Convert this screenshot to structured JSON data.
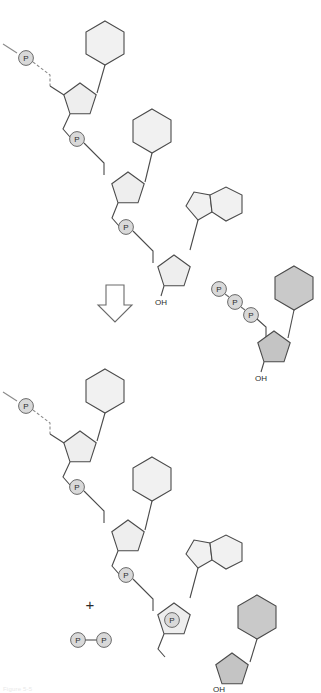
{
  "figure": {
    "kind": "biochemistry-reaction-schematic",
    "caption_partial": "Figure 5-5"
  },
  "labels": {
    "phosphate": "P",
    "hydroxyl": "OH",
    "plus": "+"
  },
  "colors": {
    "stroke": "#4a4a4a",
    "stroke_light": "#8a8a8a",
    "base_pale": "#f1f1f1",
    "base_shaded": "#c9c9c9",
    "sugar_pale": "#eeeeee",
    "sugar_shaded": "#c4c4c4",
    "phosphate_fill": "#d9d9d9",
    "text": "#2b2b2b",
    "arrow_fill": "#ffffff"
  },
  "reactants": {
    "primer_strand": {
      "name": "growing-dna-strand-3-prime-end",
      "chain_continues_label": "",
      "terminal_group": "OH",
      "phosphate_count": 3,
      "nucleotides": [
        {
          "index": 1,
          "base_type": "pyrimidine-hexagon",
          "shaded": false
        },
        {
          "index": 2,
          "base_type": "pyrimidine-hexagon",
          "shaded": false
        },
        {
          "index": 3,
          "base_type": "purine-fused-ring",
          "shaded": false
        }
      ]
    },
    "incoming_nucleotide": {
      "name": "deoxynucleoside-triphosphate",
      "phosphate_count": 3,
      "base_type": "pyrimidine-hexagon",
      "shaded": true,
      "terminal_group": "OH"
    }
  },
  "arrow": {
    "name": "reaction-arrow",
    "direction": "down"
  },
  "products": {
    "extended_strand": {
      "name": "extended-dna-strand",
      "terminal_group": "OH",
      "phosphate_count": 4,
      "nucleotides": [
        {
          "index": 1,
          "base_type": "pyrimidine-hexagon",
          "shaded": false
        },
        {
          "index": 2,
          "base_type": "pyrimidine-hexagon",
          "shaded": false
        },
        {
          "index": 3,
          "base_type": "purine-fused-ring",
          "shaded": false
        },
        {
          "index": 4,
          "base_type": "pyrimidine-hexagon",
          "shaded": true
        }
      ]
    },
    "pyrophosphate": {
      "name": "pyrophosphate",
      "phosphate_count": 2,
      "labels": [
        "P",
        "P"
      ]
    }
  }
}
